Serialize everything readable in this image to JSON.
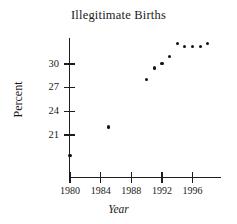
{
  "chart_data": {
    "type": "scatter",
    "title": "Illegitimate Births",
    "xlabel": "Year",
    "ylabel": "Percent",
    "x": [
      1980,
      1985,
      1990,
      1991,
      1992,
      1993,
      1994,
      1995,
      1996,
      1997,
      1998
    ],
    "values": [
      18.4,
      22.0,
      28.0,
      29.5,
      30.1,
      31.0,
      32.6,
      32.2,
      32.2,
      32.2,
      32.6
    ],
    "series": [
      {
        "name": "Illegitimate births",
        "points": [
          {
            "x": 1980,
            "y": 18.4
          },
          {
            "x": 1985,
            "y": 22.0
          },
          {
            "x": 1990,
            "y": 28.0
          },
          {
            "x": 1991,
            "y": 29.5
          },
          {
            "x": 1992,
            "y": 30.1
          },
          {
            "x": 1993,
            "y": 31.0
          },
          {
            "x": 1994,
            "y": 32.6
          },
          {
            "x": 1995,
            "y": 32.2
          },
          {
            "x": 1996,
            "y": 32.2
          },
          {
            "x": 1997,
            "y": 32.2
          },
          {
            "x": 1998,
            "y": 32.6
          }
        ]
      }
    ],
    "xticks": [
      1980,
      1984,
      1988,
      1992,
      1996
    ],
    "xtick_labels": [
      "1980",
      "1984",
      "1988",
      "1992",
      "1996"
    ],
    "yticks": [
      21,
      24,
      27,
      30
    ],
    "ytick_labels": [
      "21",
      "24",
      "27",
      "30"
    ],
    "xlim": [
      1979,
      1999
    ],
    "ylim": [
      17,
      34
    ],
    "grid": false,
    "legend": false,
    "marker_color": "#111111",
    "axis_color": "#1d1d1d"
  }
}
